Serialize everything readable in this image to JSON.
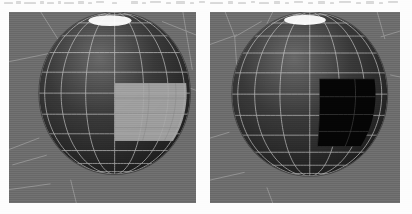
{
  "figure": {
    "kind": "scanned-figure",
    "page_background": "#fdfdfd",
    "width": 412,
    "height": 214,
    "caption": ""
  },
  "scan_artifacts": {
    "description": "faint illegible bleed-through marks along the top edge",
    "opacity": 0.3,
    "color": "#8d8d8d",
    "marks": [
      {
        "x": 4,
        "y": 2,
        "w": 9,
        "h": 2
      },
      {
        "x": 16,
        "y": 1,
        "w": 5,
        "h": 3
      },
      {
        "x": 24,
        "y": 2,
        "w": 12,
        "h": 2
      },
      {
        "x": 40,
        "y": 1,
        "w": 4,
        "h": 3
      },
      {
        "x": 47,
        "y": 2,
        "w": 7,
        "h": 2
      },
      {
        "x": 58,
        "y": 1,
        "w": 3,
        "h": 3
      },
      {
        "x": 64,
        "y": 2,
        "w": 10,
        "h": 2
      },
      {
        "x": 78,
        "y": 1,
        "w": 6,
        "h": 3
      },
      {
        "x": 88,
        "y": 2,
        "w": 4,
        "h": 2
      },
      {
        "x": 96,
        "y": 1,
        "w": 8,
        "h": 2
      },
      {
        "x": 112,
        "y": 2,
        "w": 5,
        "h": 2
      },
      {
        "x": 131,
        "y": 1,
        "w": 7,
        "h": 3
      },
      {
        "x": 142,
        "y": 2,
        "w": 4,
        "h": 2
      },
      {
        "x": 150,
        "y": 1,
        "w": 11,
        "h": 2
      },
      {
        "x": 166,
        "y": 2,
        "w": 5,
        "h": 2
      },
      {
        "x": 176,
        "y": 1,
        "w": 9,
        "h": 3
      },
      {
        "x": 190,
        "y": 2,
        "w": 4,
        "h": 2
      },
      {
        "x": 199,
        "y": 1,
        "w": 6,
        "h": 2
      },
      {
        "x": 210,
        "y": 2,
        "w": 13,
        "h": 2
      },
      {
        "x": 228,
        "y": 1,
        "w": 5,
        "h": 3
      },
      {
        "x": 238,
        "y": 2,
        "w": 8,
        "h": 2
      },
      {
        "x": 251,
        "y": 1,
        "w": 4,
        "h": 2
      },
      {
        "x": 259,
        "y": 2,
        "w": 10,
        "h": 2
      },
      {
        "x": 274,
        "y": 1,
        "w": 6,
        "h": 3
      },
      {
        "x": 285,
        "y": 2,
        "w": 4,
        "h": 2
      },
      {
        "x": 294,
        "y": 1,
        "w": 9,
        "h": 2
      },
      {
        "x": 308,
        "y": 2,
        "w": 5,
        "h": 2
      },
      {
        "x": 318,
        "y": 1,
        "w": 7,
        "h": 3
      },
      {
        "x": 330,
        "y": 2,
        "w": 4,
        "h": 2
      },
      {
        "x": 339,
        "y": 1,
        "w": 12,
        "h": 2
      },
      {
        "x": 356,
        "y": 2,
        "w": 5,
        "h": 2
      },
      {
        "x": 366,
        "y": 1,
        "w": 8,
        "h": 3
      },
      {
        "x": 379,
        "y": 2,
        "w": 4,
        "h": 2
      },
      {
        "x": 388,
        "y": 1,
        "w": 10,
        "h": 2
      }
    ]
  },
  "panels": [
    {
      "id": "left",
      "name": "viewport-left",
      "label": "",
      "frame": {
        "x": 9,
        "y": 12,
        "w": 187,
        "h": 191
      },
      "background_color": "#6e6e6e",
      "sphere": {
        "center_x": 0.565,
        "center_y": 0.425,
        "radius_x": 0.405,
        "radius_y": 0.425,
        "base_color": "#3a3a3a",
        "shaded_light_color": "#6a6a6a",
        "shaded_dark_color": "#151515",
        "wire_color": "#d8d8d8",
        "wire_opacity": 0.8,
        "longitude_count": 16,
        "latitude_count": 12,
        "specular": {
          "present": true,
          "color": "#ffffff",
          "cx": 0.54,
          "cy": 0.045,
          "rx": 0.115,
          "ry": 0.028
        }
      },
      "selection_patch": {
        "state": "highlighted",
        "fill_color": "#a8a8a8",
        "fill_opacity": 0.92,
        "wire_through_color": "#8c8c8c",
        "u_start": 0.5,
        "u_end": 0.8,
        "v_start": 0.46,
        "v_end": 0.7,
        "columns": 4,
        "rows": 4
      },
      "construction_lines": [
        {
          "x1": 0.0,
          "y1": 0.26,
          "x2": 0.3,
          "y2": 0.2
        },
        {
          "x1": 0.17,
          "y1": 0.0,
          "x2": 0.28,
          "y2": 0.17
        },
        {
          "x1": 0.62,
          "y1": 0.0,
          "x2": 0.6,
          "y2": 0.09
        },
        {
          "x1": 0.82,
          "y1": 0.05,
          "x2": 1.0,
          "y2": 0.12
        },
        {
          "x1": 0.93,
          "y1": 0.0,
          "x2": 0.98,
          "y2": 0.3
        },
        {
          "x1": 0.97,
          "y1": 0.4,
          "x2": 1.0,
          "y2": 0.41
        },
        {
          "x1": 0.0,
          "y1": 0.72,
          "x2": 0.16,
          "y2": 0.66
        },
        {
          "x1": 0.02,
          "y1": 0.8,
          "x2": 0.2,
          "y2": 0.75
        },
        {
          "x1": 0.33,
          "y1": 0.88,
          "x2": 0.36,
          "y2": 1.0
        },
        {
          "x1": 0.0,
          "y1": 0.93,
          "x2": 0.22,
          "y2": 0.9
        }
      ]
    },
    {
      "id": "right",
      "name": "viewport-right",
      "label": "",
      "frame": {
        "x": 210,
        "y": 12,
        "w": 190,
        "h": 191
      },
      "background_color": "#6e6e6e",
      "sphere": {
        "center_x": 0.525,
        "center_y": 0.43,
        "radius_x": 0.41,
        "radius_y": 0.43,
        "base_color": "#3a3a3a",
        "shaded_light_color": "#6a6a6a",
        "shaded_dark_color": "#151515",
        "wire_color": "#d8d8d8",
        "wire_opacity": 0.8,
        "longitude_count": 16,
        "latitude_count": 12,
        "specular": {
          "present": true,
          "color": "#ffffff",
          "cx": 0.5,
          "cy": 0.042,
          "rx": 0.11,
          "ry": 0.026
        }
      },
      "selection_patch": {
        "state": "blackened",
        "fill_color": "#050505",
        "fill_opacity": 1.0,
        "wire_through_color": "#4a4a4a",
        "u_start": 0.52,
        "u_end": 0.84,
        "v_start": 0.44,
        "v_end": 0.72,
        "columns": 4,
        "rows": 4
      },
      "construction_lines": [
        {
          "x1": 0.0,
          "y1": 0.17,
          "x2": 0.14,
          "y2": 0.12
        },
        {
          "x1": 0.08,
          "y1": 0.0,
          "x2": 0.13,
          "y2": 0.13
        },
        {
          "x1": 0.13,
          "y1": 0.13,
          "x2": 0.15,
          "y2": 0.42
        },
        {
          "x1": 0.13,
          "y1": 0.13,
          "x2": 0.27,
          "y2": 0.05
        },
        {
          "x1": 0.33,
          "y1": 0.0,
          "x2": 0.3,
          "y2": 0.06
        },
        {
          "x1": 0.88,
          "y1": 0.0,
          "x2": 0.92,
          "y2": 0.14
        },
        {
          "x1": 0.9,
          "y1": 0.13,
          "x2": 1.0,
          "y2": 0.1
        },
        {
          "x1": 0.95,
          "y1": 0.33,
          "x2": 1.0,
          "y2": 0.34
        },
        {
          "x1": 0.0,
          "y1": 0.66,
          "x2": 0.1,
          "y2": 0.63
        },
        {
          "x1": 0.0,
          "y1": 0.88,
          "x2": 0.18,
          "y2": 0.84
        },
        {
          "x1": 0.3,
          "y1": 0.92,
          "x2": 0.33,
          "y2": 1.0
        }
      ]
    }
  ]
}
